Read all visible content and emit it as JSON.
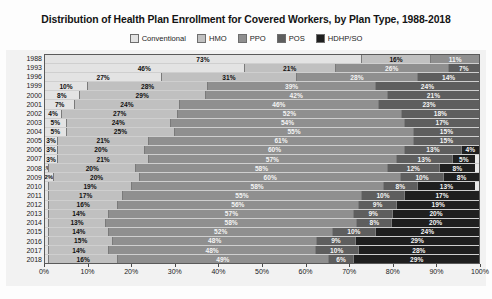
{
  "chart_data": {
    "type": "bar",
    "orientation": "horizontal",
    "stacked": true,
    "stack_total": 100,
    "title": "Distribution of Health Plan Enrollment for Covered Workers, by Plan Type, 1988-2018",
    "xlabel": "",
    "ylabel": "",
    "xlim": [
      0,
      100
    ],
    "grid": true,
    "legend_position": "top",
    "value_suffix": "%",
    "xticks": [
      "0%",
      "10%",
      "20%",
      "30%",
      "40%",
      "50%",
      "60%",
      "70%",
      "80%",
      "90%",
      "100%"
    ],
    "xtick_values": [
      0,
      10,
      20,
      30,
      40,
      50,
      60,
      70,
      80,
      90,
      100
    ],
    "categories": [
      "1988",
      "1993",
      "1996",
      "1999",
      "2000",
      "2001",
      "2002",
      "2003",
      "2004",
      "2005",
      "2006",
      "2007",
      "2008",
      "2009",
      "2010",
      "2011",
      "2012",
      "2013",
      "2014",
      "2015",
      "2016",
      "2017",
      "2018"
    ],
    "series": [
      {
        "name": "Conventional",
        "color": "#e3e3e3",
        "values": [
          73,
          46,
          27,
          10,
          8,
          7,
          4,
          5,
          5,
          3,
          3,
          3,
          1,
          2,
          1,
          1,
          1,
          1,
          1,
          1,
          1,
          1,
          1
        ]
      },
      {
        "name": "HMO",
        "color": "#c0c0c0",
        "values": [
          16,
          21,
          31,
          28,
          29,
          24,
          27,
          24,
          25,
          21,
          20,
          21,
          20,
          20,
          19,
          17,
          16,
          14,
          13,
          14,
          15,
          14,
          16
        ]
      },
      {
        "name": "PPO",
        "color": "#8f8f8f",
        "values": [
          11,
          26,
          28,
          39,
          42,
          46,
          52,
          54,
          55,
          61,
          60,
          57,
          58,
          60,
          58,
          55,
          56,
          57,
          58,
          52,
          48,
          48,
          49
        ]
      },
      {
        "name": "POS",
        "color": "#5e5e5e",
        "values": [
          0,
          7,
          14,
          24,
          21,
          23,
          18,
          17,
          15,
          15,
          13,
          13,
          12,
          10,
          8,
          10,
          9,
          9,
          8,
          10,
          9,
          10,
          6
        ]
      },
      {
        "name": "HDHP/SO",
        "color": "#1f1f1f",
        "values": [
          0,
          0,
          0,
          0,
          0,
          0,
          0,
          0,
          0,
          0,
          4,
          5,
          8,
          8,
          13,
          17,
          19,
          20,
          20,
          24,
          29,
          28,
          29
        ]
      }
    ],
    "visible_labels": {
      "1988": [
        "73%",
        "16%",
        "11%"
      ],
      "1993": [
        "46%",
        "21%",
        "26%",
        "7%"
      ],
      "1996": [
        "27%",
        "31%",
        "28%",
        "14%"
      ],
      "1999": [
        "10%",
        "28%",
        "39%",
        "24%"
      ],
      "2000": [
        "8%",
        "29%",
        "42%",
        "21%"
      ],
      "2001": [
        "7%",
        "24%",
        "46%",
        "23%"
      ],
      "2002": [
        "4%",
        "27%",
        "52%",
        "18%"
      ],
      "2003": [
        "5%",
        "24%",
        "54%",
        "17%"
      ],
      "2004": [
        "5%",
        "25%",
        "55%",
        "15%"
      ],
      "2005": [
        "3%",
        "21%",
        "61%",
        "15%"
      ],
      "2006": [
        "3%",
        "20%",
        "60%",
        "13%",
        "4%"
      ],
      "2007": [
        "3%",
        "21%",
        "57%",
        "13%",
        "5%"
      ],
      "2008": [
        "1%",
        "20%",
        "58%",
        "12%",
        "8%"
      ],
      "2009": [
        "2%",
        "20%",
        "60%",
        "10%",
        "8%"
      ],
      "2010": [
        "19%",
        "58%",
        "8%",
        "13%"
      ],
      "2011": [
        "17%",
        "55%",
        "10%",
        "17%"
      ],
      "2012": [
        "16%",
        "56%",
        "9%",
        "19%"
      ],
      "2013": [
        "14%",
        "57%",
        "9%",
        "20%"
      ],
      "2014": [
        "13%",
        "58%",
        "8%",
        "20%"
      ],
      "2015": [
        "14%",
        "52%",
        "10%",
        "24%"
      ],
      "2016": [
        "15%",
        "48%",
        "9%",
        "29%"
      ],
      "2017": [
        "14%",
        "48%",
        "10%",
        "28%"
      ],
      "2018": [
        "16%",
        "49%",
        "6%",
        "29%"
      ]
    }
  }
}
